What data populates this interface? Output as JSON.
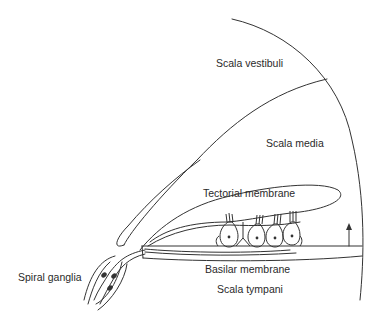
{
  "diagram": {
    "labels": {
      "scala_vestibuli": "Scala vestibuli",
      "scala_media": "Scala media",
      "tectorial_membrane": "Tectorial membrane",
      "basilar_membrane": "Basilar membrane",
      "scala_tympani": "Scala tympani",
      "spiral_ganglia": "Spiral ganglia"
    },
    "hair_cells": {
      "inner_count": 1,
      "outer_count": 3
    },
    "arrow_direction": "up",
    "colors": {
      "line": "#333333",
      "text": "#2a2a2a",
      "background": "#ffffff"
    }
  }
}
